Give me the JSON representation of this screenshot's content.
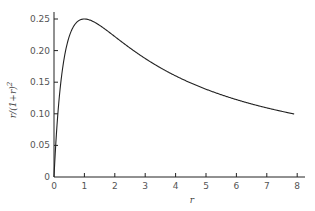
{
  "chart_data": {
    "type": "line",
    "title": "",
    "xlabel": "r",
    "ylabel": "r/(1+r)^2",
    "xlim": [
      0,
      8.2
    ],
    "ylim": [
      0,
      0.26
    ],
    "x_ticks": [
      "0",
      "1",
      "2",
      "3",
      "4",
      "5",
      "6",
      "7",
      "8"
    ],
    "y_ticks": [
      "0",
      "0.05",
      "0.10",
      "0.15",
      "0.20",
      "0.25"
    ],
    "grid": false,
    "legend": null,
    "function": "r/(1+r)^2",
    "series": [
      {
        "name": "r/(1+r)^2",
        "x": [
          0,
          0.1,
          0.2,
          0.3,
          0.5,
          0.75,
          1.0,
          1.5,
          2.0,
          2.5,
          3.0,
          4.0,
          5.0,
          6.0,
          7.0,
          7.9
        ],
        "values": [
          0,
          0.083,
          0.139,
          0.178,
          0.222,
          0.245,
          0.25,
          0.24,
          0.222,
          0.204,
          0.1875,
          0.16,
          0.139,
          0.122,
          0.109,
          0.0997
        ]
      }
    ],
    "annotations": [
      {
        "text": "maximum 0.25 at r = 1"
      }
    ]
  }
}
